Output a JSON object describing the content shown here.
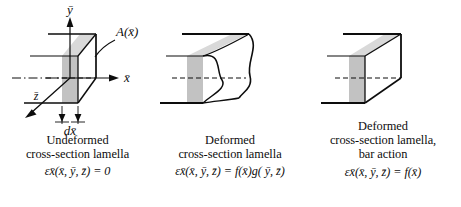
{
  "figure": {
    "colors": {
      "line": "#0d0d0d",
      "lamella_front": "#bfbfbf",
      "lamella_top": "#d8d8d8",
      "background": "#ffffff"
    }
  },
  "panels": [
    {
      "id": "undeformed",
      "shape": "box-3d",
      "axes": {
        "y_label": "ȳ",
        "x_label": "x̄",
        "z_label": "z̄"
      },
      "area_label": "A(x̄)",
      "dimension_label": "dx̄",
      "caption_lines": [
        "Undeformed",
        "cross-section lamella"
      ],
      "equation": {
        "symbol": "ε",
        "subscript": "x̄",
        "arguments": "(x̄, ȳ, z̄)",
        "operator": "=",
        "right_side": "0",
        "full": "εx̄(x̄, ȳ, z̄) = 0"
      }
    },
    {
      "id": "deformed-warped",
      "shape": "warped-box",
      "caption_lines": [
        "Deformed",
        "cross-section lamella"
      ],
      "equation": {
        "symbol": "ε",
        "subscript": "x̄",
        "arguments": "(x̄, ȳ, z̄)",
        "operator": "=",
        "right_side": "f(x̄)g( ȳ, z̄)",
        "full": "εx̄(x̄, ȳ, z̄) = f(x̄)g( ȳ, z̄)"
      }
    },
    {
      "id": "deformed-bar-action",
      "shape": "box-3d-plain",
      "caption_lines": [
        "Deformed",
        "cross-section lamella,",
        "bar action"
      ],
      "equation": {
        "symbol": "ε",
        "subscript": "x̄",
        "arguments": "(x̄, ȳ, z̄)",
        "operator": "=",
        "right_side": "f(x̄)",
        "full": "εx̄(x̄, ȳ, z̄) = f(x̄)"
      }
    }
  ]
}
